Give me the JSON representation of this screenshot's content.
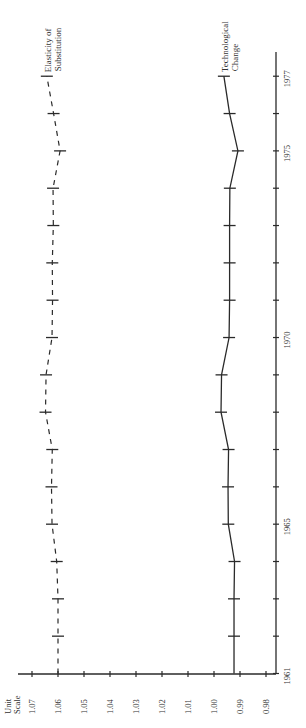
{
  "chart_data": {
    "type": "line",
    "orientation": "rotated 90deg counter-clockwise (years run bottom-to-top on right side; values run right-to-left along bottom)",
    "title": "",
    "xlabel": "",
    "ylabel": "Unit Scale",
    "ylabel_lines": [
      "Unit",
      "Scale"
    ],
    "x": [
      1961,
      1962,
      1963,
      1964,
      1965,
      1966,
      1967,
      1968,
      1969,
      1970,
      1971,
      1972,
      1973,
      1974,
      1975,
      1976,
      1977
    ],
    "x_tick_labels": [
      {
        "year": 1961,
        "label": "1961"
      },
      {
        "year": 1965,
        "label": "1965"
      },
      {
        "year": 1970,
        "label": "1970"
      },
      {
        "year": 1975,
        "label": "1975"
      },
      {
        "year": 1977,
        "label": "1977"
      }
    ],
    "y_ticks": [
      1.07,
      1.06,
      1.05,
      1.04,
      1.03,
      1.02,
      1.01,
      1.0,
      0.99,
      0.98
    ],
    "y_tick_labels": [
      "1.07",
      "1.06",
      "1.05",
      "1.04",
      "1.03",
      "1.02",
      "1.01",
      "1.00",
      "0.99",
      "0.98"
    ],
    "ylim": [
      0.98,
      1.07
    ],
    "xlim": [
      1961,
      1977
    ],
    "grid": false,
    "legend": "inline labels at end of each series (top)",
    "series": [
      {
        "name": "Elasticity of Substitution",
        "label_lines": [
          "Elasticity of",
          "Substitution"
        ],
        "style": "dashed",
        "values": [
          1.06,
          1.06,
          1.06,
          1.0605,
          1.0623,
          1.0625,
          1.0622,
          1.0648,
          1.0646,
          1.0623,
          1.0621,
          1.0622,
          1.0618,
          1.0619,
          1.0592,
          1.0617,
          1.0643
        ]
      },
      {
        "name": "Technological Change",
        "label_lines": [
          "Technological",
          "Change"
        ],
        "style": "solid",
        "values": [
          0.9923,
          0.9923,
          0.9923,
          0.9921,
          0.9945,
          0.9946,
          0.9944,
          0.9973,
          0.9971,
          0.9942,
          0.994,
          0.994,
          0.994,
          0.9939,
          0.9908,
          0.994,
          0.9962
        ]
      }
    ]
  },
  "colors": {
    "ink": "#2a2a2a",
    "background": "#ffffff"
  }
}
